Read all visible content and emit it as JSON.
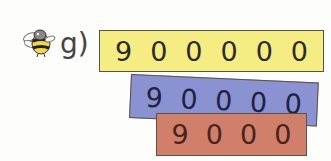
{
  "exercise": {
    "label": "g)",
    "icon": "bee-icon"
  },
  "strips": [
    {
      "name": "yellow-strip",
      "color": "#f6ec84",
      "digits": [
        "9",
        "0",
        "0",
        "0",
        "0",
        "0"
      ]
    },
    {
      "name": "blue-strip",
      "color": "#8a92d2",
      "digits": [
        "9",
        "0",
        "0",
        "0",
        "0"
      ]
    },
    {
      "name": "red-strip",
      "color": "#cf7f6a",
      "digits": [
        "9",
        "0",
        "0",
        "0"
      ]
    }
  ]
}
